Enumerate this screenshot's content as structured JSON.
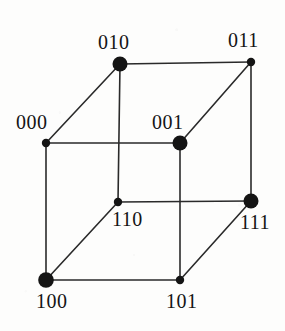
{
  "figure": {
    "width": 285,
    "height": 331,
    "background_color": "#fdfdfc",
    "ink_color": "#141414",
    "edge_color": "#2a2a2a",
    "edge_width": 1.6
  },
  "vertices": [
    {
      "id": "v010",
      "label": "010",
      "x": 120,
      "y": 64,
      "radius": 7.5,
      "emphasis": "large",
      "label_x": 98,
      "label_y": 32
    },
    {
      "id": "v011",
      "label": "011",
      "x": 251,
      "y": 62,
      "radius": 4.2,
      "emphasis": "small",
      "label_x": 228,
      "label_y": 30
    },
    {
      "id": "v000",
      "label": "000",
      "x": 46,
      "y": 143,
      "radius": 4.2,
      "emphasis": "small",
      "label_x": 16,
      "label_y": 112
    },
    {
      "id": "v001",
      "label": "001",
      "x": 180,
      "y": 143,
      "radius": 7.5,
      "emphasis": "large",
      "label_x": 152,
      "label_y": 112
    },
    {
      "id": "v110",
      "label": "110",
      "x": 118,
      "y": 202,
      "radius": 4.2,
      "emphasis": "small",
      "label_x": 112,
      "label_y": 209
    },
    {
      "id": "v111",
      "label": "111",
      "x": 251,
      "y": 201,
      "radius": 7.5,
      "emphasis": "large",
      "label_x": 240,
      "label_y": 212
    },
    {
      "id": "v100",
      "label": "100",
      "x": 46,
      "y": 280,
      "radius": 7.8,
      "emphasis": "large",
      "label_x": 36,
      "label_y": 291
    },
    {
      "id": "v101",
      "label": "101",
      "x": 180,
      "y": 280,
      "radius": 4.2,
      "emphasis": "small",
      "label_x": 166,
      "label_y": 291
    }
  ],
  "edges": [
    {
      "id": "e-010-011",
      "from": "v010",
      "to": "v011",
      "x1": 120,
      "y1": 64,
      "x2": 251,
      "y2": 62,
      "kind": "horizontal"
    },
    {
      "id": "e-000-001",
      "from": "v000",
      "to": "v001",
      "x1": 46,
      "y1": 143,
      "x2": 180,
      "y2": 143,
      "kind": "horizontal"
    },
    {
      "id": "e-110-111",
      "from": "v110",
      "to": "v111",
      "x1": 118,
      "y1": 202,
      "x2": 251,
      "y2": 201,
      "kind": "horizontal"
    },
    {
      "id": "e-100-101",
      "from": "v100",
      "to": "v101",
      "x1": 46,
      "y1": 280,
      "x2": 180,
      "y2": 280,
      "kind": "horizontal"
    },
    {
      "id": "e-010-110",
      "from": "v010",
      "to": "v110",
      "x1": 120,
      "y1": 64,
      "x2": 118,
      "y2": 202,
      "kind": "vertical"
    },
    {
      "id": "e-011-111",
      "from": "v011",
      "to": "v111",
      "x1": 251,
      "y1": 62,
      "x2": 251,
      "y2": 201,
      "kind": "vertical"
    },
    {
      "id": "e-000-100",
      "from": "v000",
      "to": "v100",
      "x1": 46,
      "y1": 143,
      "x2": 46,
      "y2": 280,
      "kind": "vertical"
    },
    {
      "id": "e-001-101",
      "from": "v001",
      "to": "v101",
      "x1": 180,
      "y1": 143,
      "x2": 180,
      "y2": 280,
      "kind": "vertical"
    },
    {
      "id": "e-000-010",
      "from": "v000",
      "to": "v010",
      "x1": 46,
      "y1": 143,
      "x2": 120,
      "y2": 64,
      "kind": "diagonal"
    },
    {
      "id": "e-001-011",
      "from": "v001",
      "to": "v011",
      "x1": 180,
      "y1": 143,
      "x2": 251,
      "y2": 62,
      "kind": "diagonal"
    },
    {
      "id": "e-100-110",
      "from": "v100",
      "to": "v110",
      "x1": 46,
      "y1": 280,
      "x2": 118,
      "y2": 202,
      "kind": "diagonal"
    },
    {
      "id": "e-101-111",
      "from": "v101",
      "to": "v111",
      "x1": 180,
      "y1": 280,
      "x2": 251,
      "y2": 201,
      "kind": "diagonal"
    }
  ]
}
